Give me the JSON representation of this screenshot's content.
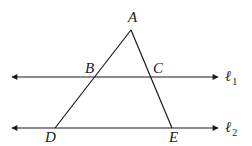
{
  "diagram": {
    "points": {
      "A": {
        "label": "A",
        "x": 131,
        "y": 30
      },
      "B": {
        "label": "B",
        "x": 95,
        "y": 77
      },
      "C": {
        "label": "C",
        "x": 151,
        "y": 77
      },
      "D": {
        "label": "D",
        "x": 55,
        "y": 128
      },
      "E": {
        "label": "E",
        "x": 172,
        "y": 128
      }
    },
    "lines": [
      {
        "name": "l1",
        "label": "ℓ",
        "subscript": "1",
        "y": 77
      },
      {
        "name": "l2",
        "label": "ℓ",
        "subscript": "2",
        "y": 128
      }
    ],
    "segments": [
      "AD",
      "AE"
    ],
    "colors": {
      "stroke": "#1a1a1a",
      "text": "#222222",
      "background": "#ffffff"
    }
  }
}
